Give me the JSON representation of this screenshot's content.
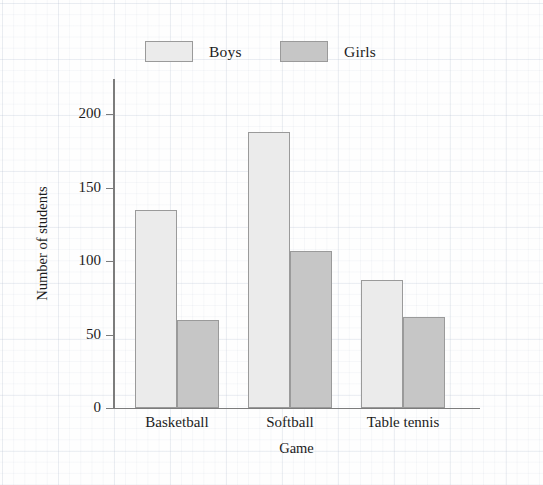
{
  "chart_data": {
    "type": "bar",
    "title": "",
    "xlabel": "Game",
    "ylabel": "Number of students",
    "categories": [
      "Basketball",
      "Softball",
      "Table tennis"
    ],
    "series": [
      {
        "name": "Boys",
        "color": "#ebebeb",
        "values": [
          135,
          188,
          87
        ]
      },
      {
        "name": "Girls",
        "color": "#c6c6c6",
        "values": [
          60,
          107,
          62
        ]
      }
    ],
    "ylim": [
      0,
      210
    ],
    "yticks": [
      0,
      50,
      100,
      150,
      200
    ],
    "ytick_labels": [
      "0",
      "50",
      "100",
      "150",
      "200"
    ],
    "grid": false,
    "legend_position": "top"
  },
  "legend": {
    "entries": [
      {
        "label": "Boys",
        "color": "#ebebeb"
      },
      {
        "label": "Girls",
        "color": "#c6c6c6"
      }
    ]
  },
  "axes": {
    "y_title": "Number of students",
    "x_title": "Game"
  }
}
